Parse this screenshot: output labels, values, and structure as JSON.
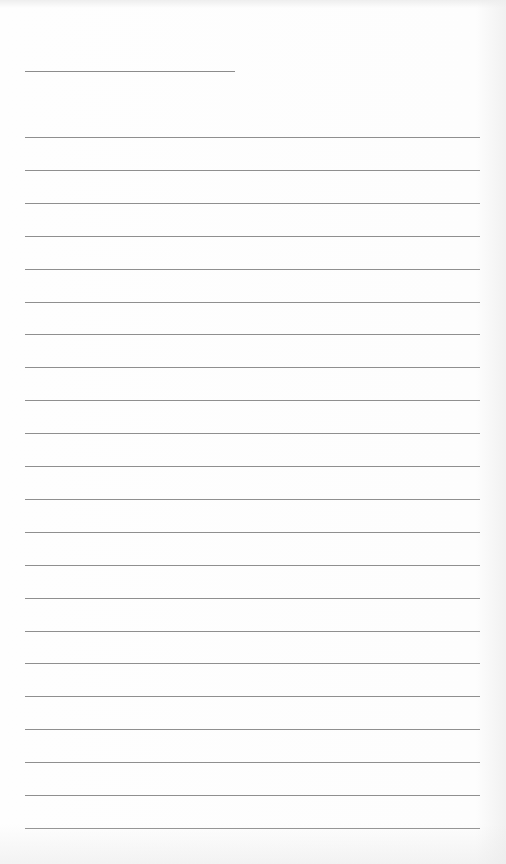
{
  "page": {
    "type": "lined-paper",
    "title_line": {
      "x": 25,
      "y": 71,
      "width": 210
    },
    "rules": {
      "count": 22,
      "first_y": 137,
      "spacing": 32.9,
      "x": 25,
      "width": 455
    },
    "line_color": "#8f8f8f",
    "background": "#fdfdfd"
  }
}
